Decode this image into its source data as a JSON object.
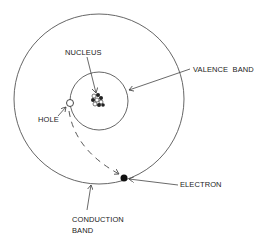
{
  "diagram": {
    "colors": {
      "line": "#555555",
      "text": "#222222",
      "background": "#ffffff"
    },
    "labels": {
      "nucleus": "NUCLEUS",
      "valence_band": "VALENCE  BAND",
      "hole": "HOLE",
      "electron": "ELECTRON",
      "conduction_band_line1": "CONDUCTION",
      "conduction_band_line2": "BAND"
    },
    "shapes": {
      "conduction_band_circle": {
        "cx": 99,
        "cy": 99,
        "r": 85
      },
      "valence_band_circle": {
        "cx": 99,
        "cy": 101,
        "r": 29
      },
      "nucleus": {
        "cx": 97,
        "cy": 100
      },
      "hole": {
        "cx": 70,
        "cy": 103,
        "r": 4
      },
      "electron": {
        "cx": 124,
        "cy": 178,
        "r": 3.5
      }
    },
    "connectors": [
      {
        "from": "nucleus-label",
        "to": "nucleus",
        "style": "solid-arrow"
      },
      {
        "from": "valence-band-label",
        "to": "valence-band-circle",
        "style": "solid-arrow"
      },
      {
        "from": "hole-label",
        "to": "hole",
        "style": "solid-arrow"
      },
      {
        "from": "electron-label",
        "to": "electron",
        "style": "solid-arrow"
      },
      {
        "from": "conduction-band-label",
        "to": "conduction-band-circle",
        "style": "solid-arrow"
      },
      {
        "from": "hole",
        "to": "electron",
        "style": "dashed-arrow"
      }
    ]
  }
}
